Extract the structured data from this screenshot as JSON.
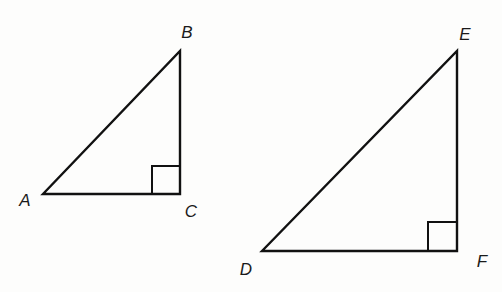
{
  "diagram": {
    "title": "",
    "stroke_color": "#111111",
    "background_color": "#fdfdfc",
    "triangles": [
      {
        "name": "triangle-ABC",
        "vertices": {
          "A": {
            "label": "A",
            "x": 43,
            "y": 194,
            "label_x": 25,
            "label_y": 200
          },
          "B": {
            "label": "B",
            "x": 180,
            "y": 51,
            "label_x": 187,
            "label_y": 32
          },
          "C": {
            "label": "C",
            "x": 180,
            "y": 194,
            "label_x": 191,
            "label_y": 211
          }
        },
        "right_angle_at": "C",
        "right_angle_marker_size": 28
      },
      {
        "name": "triangle-DEF",
        "vertices": {
          "D": {
            "label": "D",
            "x": 262,
            "y": 251,
            "label_x": 246,
            "label_y": 269
          },
          "E": {
            "label": "E",
            "x": 457,
            "y": 51,
            "label_x": 465,
            "label_y": 34
          },
          "F": {
            "label": "F",
            "x": 457,
            "y": 251,
            "label_x": 482,
            "label_y": 261
          }
        },
        "right_angle_at": "F",
        "right_angle_marker_size": 29
      }
    ],
    "labels": {
      "A": "A",
      "B": "B",
      "C": "C",
      "D": "D",
      "E": "E",
      "F": "F"
    }
  }
}
